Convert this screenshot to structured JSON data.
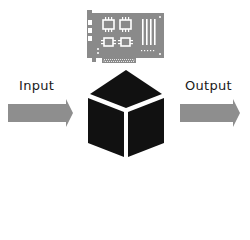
{
  "diagram": {
    "title": "",
    "input": {
      "label": "Input"
    },
    "output": {
      "label": "Output"
    },
    "process": {
      "icon": "black-box-cube-icon"
    },
    "hardware": {
      "icon": "circuit-card-icon"
    }
  },
  "colors": {
    "arrow": "#8e8e8e",
    "card": "#8a8a8a",
    "cube": "#111111",
    "text": "#1a1a1a",
    "background": "#ffffff"
  }
}
